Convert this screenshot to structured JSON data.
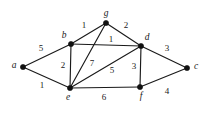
{
  "figure": {
    "type": "weighted-undirected-graph",
    "background_color": "#ffffff",
    "ink_color": "#1a1a1a",
    "width": 216,
    "height": 119
  },
  "chart_data": {
    "type": "diagram",
    "title": "",
    "nodes": [
      {
        "id": "a",
        "label": "a",
        "x": 23,
        "y": 67,
        "label_dx": -9,
        "label_dy": -1
      },
      {
        "id": "b",
        "label": "b",
        "x": 71,
        "y": 44,
        "label_dx": -7,
        "label_dy": -8
      },
      {
        "id": "c",
        "label": "c",
        "x": 187,
        "y": 68,
        "label_dx": 9,
        "label_dy": -1
      },
      {
        "id": "d",
        "label": "d",
        "x": 141,
        "y": 46,
        "label_dx": 6,
        "label_dy": -8
      },
      {
        "id": "e",
        "label": "e",
        "x": 70,
        "y": 88,
        "label_dx": -2,
        "label_dy": 10
      },
      {
        "id": "f",
        "label": "f",
        "x": 140,
        "y": 87,
        "label_dx": 1,
        "label_dy": 10
      },
      {
        "id": "g",
        "label": "g",
        "x": 106,
        "y": 23,
        "label_dx": 0,
        "label_dy": -9
      }
    ],
    "edges": [
      {
        "source": "a",
        "target": "b",
        "weight": "5",
        "wx": 41,
        "wy": 49
      },
      {
        "source": "a",
        "target": "e",
        "weight": "1",
        "wx": 42,
        "wy": 86
      },
      {
        "source": "b",
        "target": "g",
        "weight": "1",
        "wx": 84,
        "wy": 26
      },
      {
        "source": "b",
        "target": "d",
        "weight": "1",
        "wx": 111,
        "wy": 40
      },
      {
        "source": "b",
        "target": "e",
        "weight": "2",
        "wx": 63,
        "wy": 66
      },
      {
        "source": "g",
        "target": "d",
        "weight": "2",
        "wx": 126,
        "wy": 26
      },
      {
        "source": "g",
        "target": "e",
        "weight": "7",
        "wx": 92,
        "wy": 64
      },
      {
        "source": "e",
        "target": "d",
        "weight": "5",
        "wx": 112,
        "wy": 71
      },
      {
        "source": "d",
        "target": "c",
        "weight": "3",
        "wx": 167,
        "wy": 49
      },
      {
        "source": "d",
        "target": "f",
        "weight": "3",
        "wx": 134,
        "wy": 67
      },
      {
        "source": "e",
        "target": "f",
        "weight": "6",
        "wx": 104,
        "wy": 98
      },
      {
        "source": "f",
        "target": "c",
        "weight": "4",
        "wx": 167,
        "wy": 92
      }
    ]
  }
}
